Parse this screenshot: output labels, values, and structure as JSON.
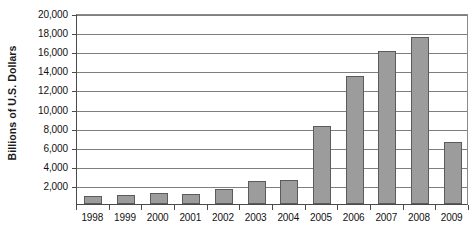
{
  "chart_data": {
    "type": "bar",
    "title": "",
    "subtitle": "",
    "xlabel": "",
    "ylabel": "Billions of U.S. Dollars",
    "categories": [
      "1998",
      "1999",
      "2000",
      "2001",
      "2002",
      "2003",
      "2004",
      "2005",
      "2006",
      "2007",
      "2008",
      "2009"
    ],
    "values": [
      800,
      950,
      1150,
      1100,
      1600,
      2450,
      2550,
      8200,
      13400,
      16000,
      17500,
      6500
    ],
    "ylim": [
      0,
      20000
    ],
    "ytick_values": [
      2000,
      4000,
      6000,
      8000,
      10000,
      12000,
      14000,
      16000,
      18000,
      20000
    ],
    "ytick_labels": [
      "2,000",
      "4,000",
      "6,000",
      "8,000",
      "10,000",
      "12,000",
      "14,000",
      "16,000",
      "18,000",
      "20,000"
    ],
    "grid": true,
    "grid_orientation": "horizontal",
    "legend": false,
    "legend_position": "none",
    "bar_fill_color": "#9c9c9c",
    "bar_border_color": "#5b5b5b",
    "gridline_color": "#7e7e7e",
    "axis_color": "#4a4a4a",
    "background_color": "#ffffff",
    "text_color": "#111111"
  }
}
